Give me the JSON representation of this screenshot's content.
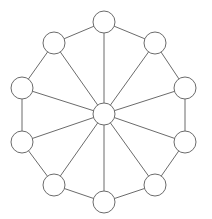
{
  "diagram": {
    "type": "wheel-graph",
    "background_color": "#ffffff",
    "stroke_color": "#6b6b6b",
    "node_fill_color": "#ffffff",
    "stroke_width": 1,
    "canvas": {
      "width": 212,
      "height": 219
    },
    "node_count": 11,
    "outer_node_count": 10,
    "hub_node_count": 1,
    "edge_count": 20,
    "spoke_count": 10,
    "rim_count": 10,
    "hub": {
      "id": "hub",
      "label": "",
      "cx": 104,
      "cy": 114,
      "r": 11
    },
    "outer_nodes": [
      {
        "id": "n0",
        "label": "",
        "cx": 104,
        "cy": 22,
        "r": 11,
        "angle_deg": 270
      },
      {
        "id": "n1",
        "label": "",
        "cx": 155,
        "cy": 43,
        "r": 11,
        "angle_deg": 306
      },
      {
        "id": "n2",
        "label": "",
        "cx": 185,
        "cy": 88,
        "r": 11,
        "angle_deg": 342
      },
      {
        "id": "n3",
        "label": "",
        "cx": 185,
        "cy": 142,
        "r": 11,
        "angle_deg": 18
      },
      {
        "id": "n4",
        "label": "",
        "cx": 155,
        "cy": 185,
        "r": 11,
        "angle_deg": 54
      },
      {
        "id": "n5",
        "label": "",
        "cx": 104,
        "cy": 202,
        "r": 11,
        "angle_deg": 90
      },
      {
        "id": "n6",
        "label": "",
        "cx": 54,
        "cy": 185,
        "r": 11,
        "angle_deg": 126
      },
      {
        "id": "n7",
        "label": "",
        "cx": 22,
        "cy": 142,
        "r": 11,
        "angle_deg": 162
      },
      {
        "id": "n8",
        "label": "",
        "cx": 22,
        "cy": 88,
        "r": 11,
        "angle_deg": 198
      },
      {
        "id": "n9",
        "label": "",
        "cx": 54,
        "cy": 43,
        "r": 11,
        "angle_deg": 234
      }
    ],
    "spokes": [
      {
        "id": "s0",
        "from": "hub",
        "to": "n0"
      },
      {
        "id": "s1",
        "from": "hub",
        "to": "n1"
      },
      {
        "id": "s2",
        "from": "hub",
        "to": "n2"
      },
      {
        "id": "s3",
        "from": "hub",
        "to": "n3"
      },
      {
        "id": "s4",
        "from": "hub",
        "to": "n4"
      },
      {
        "id": "s5",
        "from": "hub",
        "to": "n5"
      },
      {
        "id": "s6",
        "from": "hub",
        "to": "n6"
      },
      {
        "id": "s7",
        "from": "hub",
        "to": "n7"
      },
      {
        "id": "s8",
        "from": "hub",
        "to": "n8"
      },
      {
        "id": "s9",
        "from": "hub",
        "to": "n9"
      }
    ],
    "rim_edges": [
      {
        "id": "r0",
        "from": "n0",
        "to": "n1"
      },
      {
        "id": "r1",
        "from": "n1",
        "to": "n2"
      },
      {
        "id": "r2",
        "from": "n2",
        "to": "n3"
      },
      {
        "id": "r3",
        "from": "n3",
        "to": "n4"
      },
      {
        "id": "r4",
        "from": "n4",
        "to": "n5"
      },
      {
        "id": "r5",
        "from": "n5",
        "to": "n6"
      },
      {
        "id": "r6",
        "from": "n6",
        "to": "n7"
      },
      {
        "id": "r7",
        "from": "n7",
        "to": "n8"
      },
      {
        "id": "r8",
        "from": "n8",
        "to": "n9"
      },
      {
        "id": "r9",
        "from": "n9",
        "to": "n0"
      }
    ]
  }
}
